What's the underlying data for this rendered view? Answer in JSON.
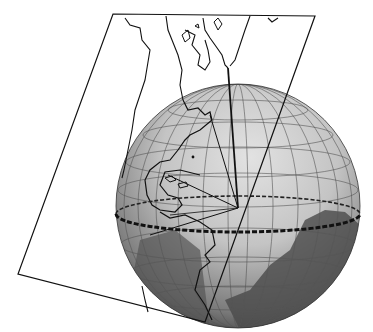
{
  "diagram": {
    "title": "",
    "elements": [
      "projection-plane",
      "globe",
      "graticule",
      "equator",
      "projection-rays",
      "coastlines"
    ],
    "colors": {
      "outline": "#111111",
      "globe_light": "#d8d8d8",
      "globe_mid": "#a8a8a8",
      "globe_dark": "#3a3a3a",
      "land_dark": "#4a4a4a",
      "background": "#ffffff"
    }
  }
}
